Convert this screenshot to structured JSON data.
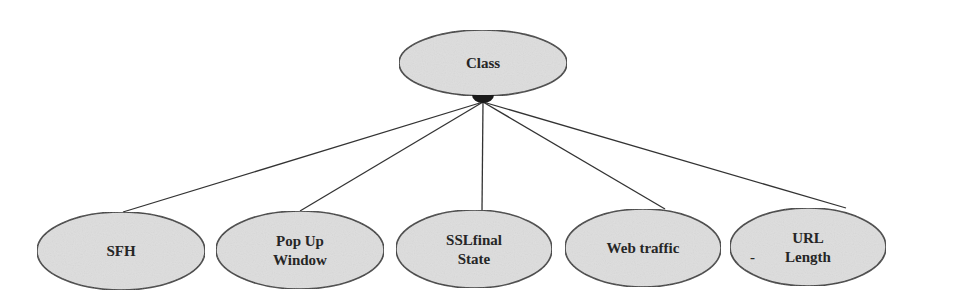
{
  "diagram": {
    "type": "tree",
    "colors": {
      "node_fill": "#dedede",
      "node_stroke": "#3a3a3a",
      "edge": "#333333",
      "hub": "#1a1a1a",
      "text": "#262626"
    },
    "root": {
      "id": "class",
      "label": "Class",
      "cx": 483,
      "cy": 63,
      "rx": 84,
      "ry": 33
    },
    "hub": {
      "shape": "filled-half-circle",
      "cx": 483,
      "cy": 97,
      "r": 11
    },
    "children": [
      {
        "id": "sfh",
        "lines": [
          "SFH"
        ],
        "cx": 121,
        "cy": 251,
        "rx": 84,
        "ry": 39,
        "edge_end": [
          123,
          212
        ]
      },
      {
        "id": "pop-up-window",
        "lines": [
          "Pop Up",
          "Window"
        ],
        "cx": 300,
        "cy": 250,
        "rx": 84,
        "ry": 39,
        "edge_end": [
          300,
          211
        ]
      },
      {
        "id": "sslfinal-state",
        "lines": [
          "SSLfinal",
          "State"
        ],
        "cx": 474,
        "cy": 249,
        "rx": 78,
        "ry": 39,
        "edge_end": [
          482,
          210
        ]
      },
      {
        "id": "web-traffic",
        "lines": [
          "Web traffic"
        ],
        "cx": 643,
        "cy": 248,
        "rx": 78,
        "ry": 39,
        "edge_end": [
          665,
          209
        ]
      },
      {
        "id": "url-length",
        "lines": [
          "URL",
          "Length"
        ],
        "prefix_mark": "-",
        "cx": 808,
        "cy": 247,
        "rx": 78,
        "ry": 39,
        "edge_end": [
          846,
          208
        ]
      }
    ],
    "edge_start": [
      483,
      102
    ]
  }
}
